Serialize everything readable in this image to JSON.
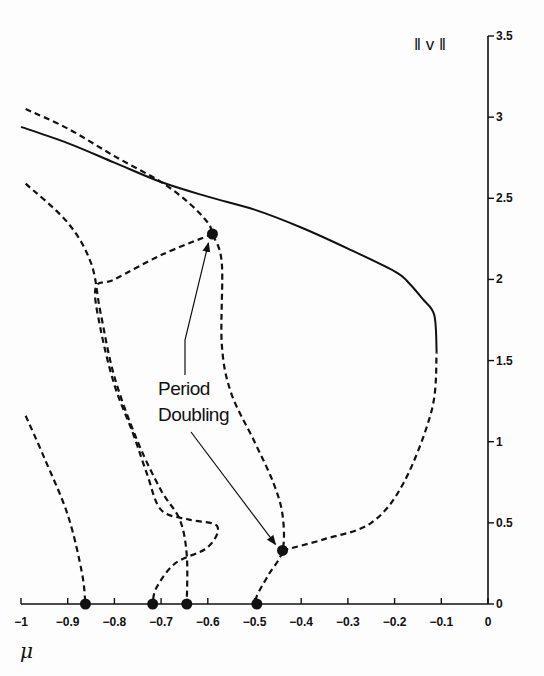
{
  "chart_data": {
    "type": "line",
    "title": "",
    "xlabel": "μ",
    "ylabel": "‖ v ‖",
    "xlim": [
      -1,
      0
    ],
    "ylim": [
      0,
      3.5
    ],
    "grid": false,
    "legend": null,
    "x_ticks": [
      "-1",
      "-0.9",
      "-0.8",
      "-0.7",
      "-0.6",
      "-0.5",
      "-0.4",
      "-0.3",
      "-0.2",
      "-0.1",
      "0"
    ],
    "y_ticks": [
      "0",
      "0.5",
      "1",
      "1.5",
      "2",
      "2.5",
      "3",
      "3.5"
    ],
    "annotation": {
      "line1": "Period",
      "line2": "Doubling",
      "targets": [
        [
          -0.59,
          2.28
        ],
        [
          -0.44,
          0.33
        ]
      ]
    },
    "series": [
      {
        "name": "stable branch (solid)",
        "style": "solid",
        "points": [
          [
            -1.0,
            2.94
          ],
          [
            -0.9,
            2.84
          ],
          [
            -0.8,
            2.72
          ],
          [
            -0.7,
            2.6
          ],
          [
            -0.6,
            2.51
          ],
          [
            -0.5,
            2.43
          ],
          [
            -0.4,
            2.32
          ],
          [
            -0.3,
            2.19
          ],
          [
            -0.2,
            2.05
          ],
          [
            -0.17,
            1.98
          ],
          [
            -0.14,
            1.88
          ],
          [
            -0.115,
            1.78
          ],
          [
            -0.11,
            1.55
          ]
        ]
      },
      {
        "name": "unstable upper branch (dashed)",
        "style": "dashed",
        "points": [
          [
            -0.99,
            3.05
          ],
          [
            -0.9,
            2.93
          ],
          [
            -0.8,
            2.76
          ],
          [
            -0.7,
            2.6
          ],
          [
            -0.64,
            2.47
          ],
          [
            -0.6,
            2.35
          ],
          [
            -0.59,
            2.28
          ],
          [
            -0.57,
            2.1
          ],
          [
            -0.57,
            1.6
          ],
          [
            -0.55,
            1.3
          ],
          [
            -0.5,
            1.0
          ],
          [
            -0.46,
            0.75
          ],
          [
            -0.44,
            0.55
          ],
          [
            -0.44,
            0.33
          ],
          [
            -0.47,
            0.18
          ],
          [
            -0.495,
            0.05
          ],
          [
            -0.495,
            0
          ]
        ]
      },
      {
        "name": "doubled branch from (-0.59,2.28)",
        "style": "dashed",
        "points": [
          [
            -0.59,
            2.28
          ],
          [
            -0.7,
            2.15
          ],
          [
            -0.8,
            2.0
          ],
          [
            -0.84,
            1.95
          ],
          [
            -0.83,
            1.7
          ],
          [
            -0.8,
            1.35
          ],
          [
            -0.76,
            1.05
          ],
          [
            -0.73,
            0.8
          ],
          [
            -0.7,
            0.58
          ],
          [
            -0.64,
            0.52
          ],
          [
            -0.58,
            0.48
          ],
          [
            -0.6,
            0.35
          ],
          [
            -0.67,
            0.25
          ],
          [
            -0.71,
            0.1
          ],
          [
            -0.718,
            0
          ]
        ]
      },
      {
        "name": "branch from μ≈-0.645",
        "style": "dashed",
        "points": [
          [
            -0.99,
            2.59
          ],
          [
            -0.9,
            2.35
          ],
          [
            -0.85,
            2.1
          ],
          [
            -0.83,
            1.8
          ],
          [
            -0.8,
            1.4
          ],
          [
            -0.75,
            1.0
          ],
          [
            -0.7,
            0.7
          ],
          [
            -0.66,
            0.52
          ],
          [
            -0.645,
            0.3
          ],
          [
            -0.645,
            0
          ]
        ]
      },
      {
        "name": "branch from μ≈-0.86",
        "style": "dashed",
        "points": [
          [
            -0.99,
            1.16
          ],
          [
            -0.95,
            0.9
          ],
          [
            -0.9,
            0.55
          ],
          [
            -0.87,
            0.2
          ],
          [
            -0.862,
            0
          ]
        ]
      },
      {
        "name": "doubled branch from (-0.44,0.33)",
        "style": "dashed",
        "points": [
          [
            -0.44,
            0.33
          ],
          [
            -0.35,
            0.4
          ],
          [
            -0.25,
            0.5
          ],
          [
            -0.18,
            0.75
          ],
          [
            -0.12,
            1.2
          ],
          [
            -0.11,
            1.55
          ]
        ]
      }
    ],
    "markers": [
      [
        -0.862,
        0
      ],
      [
        -0.718,
        0
      ],
      [
        -0.645,
        0
      ],
      [
        -0.495,
        0
      ],
      [
        -0.59,
        2.28
      ],
      [
        -0.44,
        0.33
      ]
    ]
  }
}
